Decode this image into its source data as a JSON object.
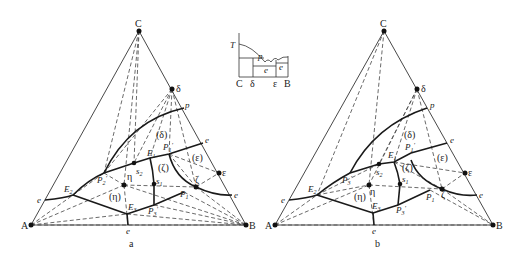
{
  "figure": {
    "inset": {
      "axis_label_T": "T",
      "bottom_labels": [
        "C",
        "δ",
        "ε",
        "B"
      ],
      "curve_labels": [
        "p",
        "e",
        "e"
      ]
    },
    "panels": [
      {
        "caption": "a",
        "vertices": {
          "A": "A",
          "B": "B",
          "C": "C"
        },
        "phase_points": {
          "delta": "δ",
          "epsilon": "ε",
          "zeta": "ζ",
          "eta": "η",
          "s1": "s",
          "s1_sub": "1",
          "s2": "s",
          "s2_sub": "2"
        },
        "invariant_points": {
          "E1": "E",
          "E1_sub": "1",
          "E2": "E",
          "E2_sub": "2",
          "E3": "E",
          "E3_sub": "3",
          "P1": "P",
          "P1_sub": "1",
          "P1p": "P",
          "P1p_sub": "1",
          "P2p": "P",
          "P2p_sub": "2",
          "P3p": "P",
          "P3p_sub": "3"
        },
        "binary_points": {
          "p": "p",
          "e": "e"
        },
        "regions": [
          "(δ)",
          "(ε)",
          "(ζ)",
          "(η)"
        ]
      },
      {
        "caption": "b",
        "vertices": {
          "A": "A",
          "B": "B",
          "C": "C"
        },
        "phase_points": {
          "delta": "δ",
          "epsilon": "ε",
          "zeta": "ζ",
          "eta": "η",
          "s1": "s",
          "s1_sub": "1",
          "s2": "s",
          "s2_sub": "2"
        },
        "invariant_points": {
          "E1": "E",
          "E1_sub": "1",
          "E2": "E",
          "E2_sub": "2",
          "E3": "E",
          "E3_sub": "3",
          "P1": "P",
          "P1_sub": "1",
          "P1p": "P",
          "P1p_sub": "1",
          "P3p_top": "P",
          "P3p_top_sub": "3",
          "P3p": "P",
          "P3p_sub": "3"
        },
        "binary_points": {
          "p": "p",
          "e": "e"
        },
        "regions": [
          "(δ)",
          "(ε)",
          "(ζ)",
          "(η)"
        ]
      }
    ]
  }
}
